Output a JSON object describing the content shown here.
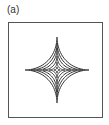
{
  "figure": {
    "panel_label": "(a)",
    "line_color": "#333333",
    "center": [
      57,
      70
    ],
    "contours": [
      {
        "rx": 32,
        "ry": 33
      },
      {
        "rx": 26,
        "ry": 27
      },
      {
        "rx": 20,
        "ry": 21
      },
      {
        "rx": 14,
        "ry": 14
      },
      {
        "rx": 8,
        "ry": 8
      },
      {
        "rx": 3,
        "ry": 3
      }
    ]
  }
}
